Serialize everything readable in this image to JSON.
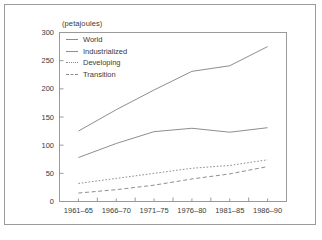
{
  "chart_data": {
    "type": "line",
    "title": "",
    "subtitle": "",
    "unit_label": "(petajoules)",
    "xlabel": "",
    "ylabel": "",
    "categories": [
      "1961–65",
      "1966–70",
      "1971–75",
      "1976–80",
      "1981–85",
      "1986–90"
    ],
    "ylim": [
      0,
      300
    ],
    "yticks": [
      0,
      50,
      100,
      150,
      200,
      250,
      300
    ],
    "grid": false,
    "legend_position": "top-left",
    "series": [
      {
        "name": "World",
        "style": "solid",
        "values": [
          125,
          163,
          198,
          231,
          241,
          275
        ]
      },
      {
        "name": "Industrialized",
        "style": "solid",
        "values": [
          78,
          103,
          124,
          130,
          123,
          131
        ]
      },
      {
        "name": "Developing",
        "style": "dotted",
        "values": [
          32,
          41,
          50,
          59,
          64,
          74
        ]
      },
      {
        "name": "Transition",
        "style": "dashed",
        "values": [
          15,
          21,
          29,
          40,
          49,
          62
        ]
      }
    ]
  },
  "axis": {
    "ytick_labels": [
      "300",
      "250",
      "200",
      "150",
      "100",
      "50",
      "0"
    ],
    "xtick_labels": [
      "1961–65",
      "1966–70",
      "1971–75",
      "1976–80",
      "1981–85",
      "1986–90"
    ]
  },
  "legend": {
    "items": [
      {
        "label": "World"
      },
      {
        "label": "Industrialized"
      },
      {
        "label": "Developing"
      },
      {
        "label": "Transition"
      }
    ]
  },
  "colors": {
    "line": "#8e8e8e",
    "axis": "#9a9a9a",
    "text": "#3a3a3a",
    "frame": "#9a9a9a",
    "background": "#ffffff"
  }
}
